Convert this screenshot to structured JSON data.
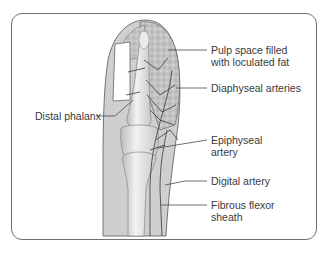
{
  "diagram": {
    "type": "anatomical-illustration",
    "labels": {
      "pulp_space": {
        "line1": "Pulp space filled",
        "line2": "with loculated fat"
      },
      "diaphyseal_arteries": "Diaphyseal arteries",
      "distal_phalanx": "Distal phalanx",
      "epiphyseal_artery": {
        "line1": "Epiphyseal",
        "line2": "artery"
      },
      "digital_artery": "Digital artery",
      "fibrous_flexor_sheath": {
        "line1": "Fibrous flexor",
        "line2": "sheath"
      }
    },
    "colors": {
      "frame": "#6f6f6f",
      "soft_tissue": "#cfcfcf",
      "pulp": "#bdbdbd",
      "bone": "#e6e6e6",
      "nail": "#ffffff",
      "vessels": "#3a3a3a",
      "text": "#3a3a3a"
    }
  }
}
